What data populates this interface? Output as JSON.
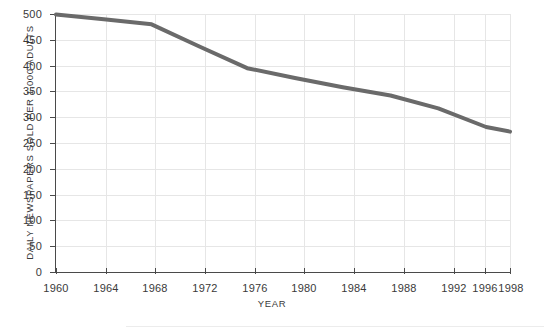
{
  "figure": {
    "title": "",
    "background_color": "#ffffff",
    "footer_rule": ""
  },
  "axis_titles": {
    "x": "YEAR",
    "y": "DAILY NEWSPAPERS SOLD PER 1,000 ADULTS"
  },
  "ticks": {
    "y": [
      "500",
      "450",
      "400",
      "350",
      "300",
      "250",
      "200",
      "150",
      "100",
      "50",
      "0"
    ],
    "x": [
      "1960",
      "1964",
      "1968",
      "1972",
      "1976",
      "1980",
      "1984",
      "1988",
      "1992",
      "1996",
      "1998"
    ]
  },
  "chart_data": {
    "type": "line",
    "title": "",
    "xlabel": "YEAR",
    "ylabel": "DAILY NEWSPAPERS SOLD PER 1,000 ADULTS",
    "x": [
      1960,
      1964,
      1968,
      1972,
      1976,
      1980,
      1984,
      1988,
      1992,
      1996,
      1998
    ],
    "values": [
      499,
      490,
      480,
      437,
      395,
      376,
      358,
      342,
      317,
      281,
      272
    ],
    "xlim": [
      1960,
      1998
    ],
    "ylim": [
      0,
      500
    ],
    "ytick_step": 50,
    "xtick_step": 4,
    "grid": true,
    "legend": "none",
    "series_color": "#6a6a6a",
    "grid_color": "#e6e6e6",
    "axis_color": "#4a4a4a",
    "line_width": 4,
    "markers": false
  }
}
